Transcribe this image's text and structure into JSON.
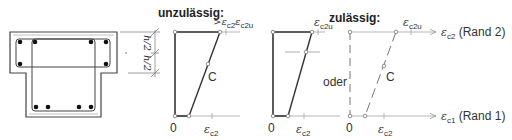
{
  "headings": {
    "invalid": "unzulässig:",
    "valid": "zulässig:"
  },
  "cross_section": {
    "dim_label_1": "h/2",
    "dim_label_2": "h/2"
  },
  "diagram_invalid": {
    "top_label_1": ">ε",
    "top_label_1_sub": "c2",
    "top_label_2": "ε",
    "top_label_2_sub": "c2u",
    "centroid_label": "C",
    "origin_label": "0",
    "bottom_label": "ε",
    "bottom_label_sub": "c2"
  },
  "diagram_valid": {
    "top_label": "ε",
    "top_label_sub": "c2u",
    "origin_label": "0",
    "bottom_label": "ε",
    "bottom_label_sub": "c2"
  },
  "separator": "oder",
  "diagram_valid_alt": {
    "top_label": "ε",
    "top_label_sub": "c2u",
    "centroid_label": "C",
    "origin_label": "0",
    "bottom_label": "ε",
    "bottom_label_sub": "c2",
    "axis_top_symbol": "ε",
    "axis_top_sub": "c2",
    "axis_top_text": "(Rand 2)",
    "axis_bottom_symbol": "ε",
    "axis_bottom_sub": "c1",
    "axis_bottom_text": "(Rand 1)"
  },
  "colors": {
    "line": "#333333",
    "thin": "#888888"
  }
}
